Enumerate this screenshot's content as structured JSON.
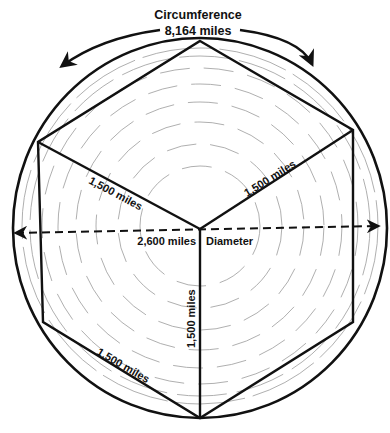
{
  "title": {
    "line1": "Circumference",
    "line2": "8,164 miles"
  },
  "labels": {
    "upper_left_edge": "1,500 miles",
    "upper_right_edge": "1,500 miles",
    "vertical_edge": "1,500 miles",
    "lower_left_edge": "1,500 miles",
    "diameter_value": "2,600 miles",
    "diameter_label": "Diameter"
  },
  "colors": {
    "ink": "#111111",
    "shading": "#9a9a9a",
    "background": "#ffffff"
  }
}
